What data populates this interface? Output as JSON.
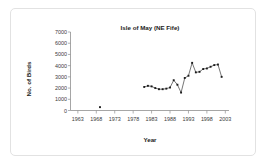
{
  "chart_data": {
    "type": "line",
    "title": "Isle of May (NE Fife)",
    "xlabel": "Year",
    "ylabel": "No. of Birds",
    "xlim": [
      1961,
      2004
    ],
    "ylim": [
      0,
      7000
    ],
    "grid": false,
    "legend": "none",
    "xticks": [
      1963,
      1968,
      1973,
      1978,
      1983,
      1988,
      1993,
      1998,
      2003
    ],
    "yticks": [
      0,
      1000,
      2000,
      3000,
      4000,
      5000,
      6000,
      7000
    ],
    "series": [
      {
        "name": "Early record",
        "style": "marker-only",
        "x": [
          1969
        ],
        "values": [
          300
        ]
      },
      {
        "name": "No. of Birds",
        "style": "line-marker",
        "x": [
          1981,
          1982,
          1983,
          1984,
          1985,
          1986,
          1987,
          1988,
          1989,
          1990,
          1991,
          1992,
          1993,
          1994,
          1995,
          1996,
          1997,
          1998,
          1999,
          2000,
          2001,
          2002
        ],
        "values": [
          2100,
          2200,
          2150,
          2000,
          1900,
          1900,
          1950,
          2050,
          2700,
          2300,
          1600,
          2900,
          3100,
          4250,
          3400,
          3450,
          3700,
          3750,
          3900,
          4050,
          4100,
          3000
        ]
      }
    ]
  },
  "axis_titles": {
    "x": "Year",
    "y": "No. of Birds"
  }
}
